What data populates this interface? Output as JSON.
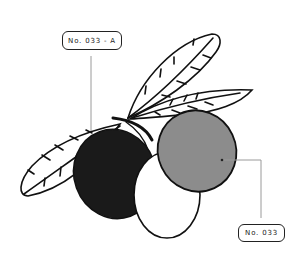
{
  "diagram": {
    "labels": [
      {
        "id": "label-a",
        "text": "No. 033 - A",
        "target": "black-olive"
      },
      {
        "id": "label-b",
        "text": "No. 033",
        "target": "gray-olive"
      }
    ],
    "olives": [
      {
        "name": "black-olive",
        "fill": "#1a1a1a"
      },
      {
        "name": "white-olive",
        "fill": "#ffffff"
      },
      {
        "name": "gray-olive",
        "fill": "#8c8c8c"
      }
    ],
    "leaves": 3,
    "colors": {
      "stroke": "#111111",
      "leader_line": "#999999",
      "background": "#ffffff"
    }
  }
}
